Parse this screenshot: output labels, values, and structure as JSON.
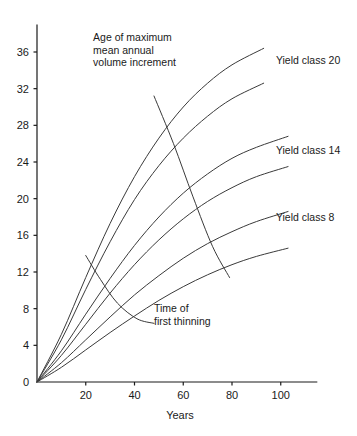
{
  "chart_data": {
    "type": "line",
    "title": "",
    "xlabel": "Years",
    "ylabel": "",
    "xlim": [
      0,
      115
    ],
    "ylim": [
      0,
      39
    ],
    "grid": false,
    "legend_position": "inline-right-of-curves",
    "x_ticks": [
      20,
      40,
      60,
      80,
      100
    ],
    "y_ticks": [
      0,
      4,
      8,
      12,
      16,
      20,
      24,
      28,
      32,
      36
    ],
    "x_tick_labels": [
      "20",
      "40",
      "60",
      "80",
      "100"
    ],
    "y_tick_labels": [
      "0",
      "4",
      "8",
      "12",
      "16",
      "20",
      "24",
      "28",
      "32",
      "36"
    ],
    "series": [
      {
        "name": "Yield class 20",
        "labelled": true,
        "x": [
          0,
          10,
          20,
          30,
          40,
          50,
          60,
          70,
          80,
          93
        ],
        "y": [
          0,
          5.2,
          11.4,
          17.3,
          22.4,
          26.6,
          30.0,
          32.6,
          34.6,
          36.4
        ]
      },
      {
        "name": "Yield class 18",
        "labelled": false,
        "x": [
          0,
          10,
          20,
          30,
          40,
          50,
          60,
          70,
          80,
          93
        ],
        "y": [
          0,
          4.6,
          10.1,
          15.3,
          19.9,
          23.6,
          26.6,
          29.0,
          30.9,
          32.6
        ]
      },
      {
        "name": "Yield class 14",
        "labelled": true,
        "x": [
          0,
          10,
          20,
          30,
          40,
          50,
          60,
          70,
          80,
          90,
          103
        ],
        "y": [
          0,
          3.4,
          7.4,
          11.3,
          14.9,
          18.0,
          20.6,
          22.7,
          24.4,
          25.6,
          26.8
        ]
      },
      {
        "name": "Yield class 12",
        "labelled": false,
        "x": [
          0,
          10,
          20,
          30,
          40,
          50,
          60,
          70,
          80,
          90,
          103
        ],
        "y": [
          0,
          2.9,
          6.3,
          9.7,
          12.8,
          15.5,
          17.8,
          19.7,
          21.2,
          22.4,
          23.5
        ]
      },
      {
        "name": "Yield class 8",
        "labelled": true,
        "x": [
          0,
          10,
          20,
          30,
          40,
          50,
          60,
          70,
          80,
          90,
          103
        ],
        "y": [
          0,
          2.1,
          4.6,
          7.1,
          9.5,
          11.6,
          13.5,
          15.1,
          16.4,
          17.5,
          18.6
        ]
      },
      {
        "name": "Yield class 6",
        "labelled": false,
        "x": [
          0,
          10,
          20,
          30,
          40,
          50,
          60,
          70,
          80,
          90,
          103
        ],
        "y": [
          0,
          1.6,
          3.5,
          5.4,
          7.2,
          8.9,
          10.4,
          11.7,
          12.8,
          13.7,
          14.6
        ]
      }
    ],
    "annotations": [
      {
        "name": "age-of-maximum-mean-annual-volume-increment",
        "text_lines": [
          "Age of maximum",
          "mean annual",
          "volume increment"
        ],
        "text_x": 23,
        "text_y": 37.2,
        "curve_x": [
          48,
          56,
          64,
          72,
          79
        ],
        "curve_y": [
          31.2,
          26.0,
          20.2,
          14.8,
          11.4
        ]
      },
      {
        "name": "time-of-first-thinning",
        "text_lines": [
          "Time of",
          "first thinning"
        ],
        "text_x": 48,
        "text_y": 7.6,
        "curve_x": [
          20,
          26,
          33,
          41,
          48
        ],
        "curve_y": [
          13.8,
          11.2,
          8.6,
          6.9,
          6.4
        ]
      }
    ],
    "series_labels": [
      {
        "name": "Yield class 20",
        "x": 98,
        "y": 35.1
      },
      {
        "name": "Yield class 14",
        "x": 98,
        "y": 25.3
      },
      {
        "name": "Yield class 8",
        "x": 98,
        "y": 18.0
      }
    ],
    "colors": {
      "line": "#3a3a3a",
      "axis": "#1a1a1a",
      "text": "#1a1a1a",
      "background": "#ffffff"
    }
  }
}
